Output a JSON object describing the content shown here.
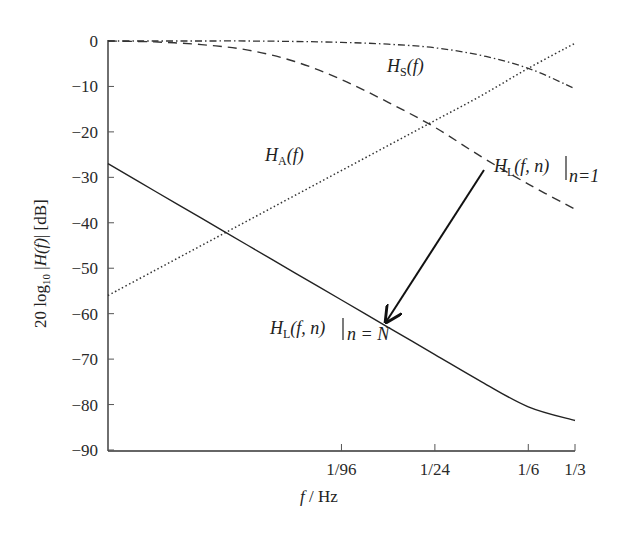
{
  "chart_data": {
    "type": "line",
    "title": "",
    "xlabel": "f / Hz",
    "ylabel": "20 log10 |H(f)| [dB]",
    "xscale": "log",
    "xlim_hz": [
      0.000326,
      0.3333
    ],
    "ylim": [
      -90,
      0
    ],
    "grid": false,
    "legend": "inline annotations",
    "x_ticks": [
      {
        "label": "1/96",
        "value": 0.0104167
      },
      {
        "label": "1/24",
        "value": 0.0416667
      },
      {
        "label": "1/6",
        "value": 0.1666667
      },
      {
        "label": "1/3",
        "value": 0.3333333
      }
    ],
    "y_ticks": [
      0,
      -10,
      -20,
      -30,
      -40,
      -50,
      -60,
      -70,
      -80,
      -90
    ],
    "y_tick_labels": [
      "0",
      "−10",
      "−20",
      "−30",
      "−40",
      "−50",
      "−60",
      "−70",
      "−80",
      "−90"
    ],
    "x_octaves_from_left": [
      0,
      1,
      2,
      3,
      4,
      5,
      6,
      7,
      8,
      9,
      10
    ],
    "series": [
      {
        "name": "H_S(f)",
        "style": "dash-dot",
        "values": [
          0,
          0,
          0,
          0,
          -0.1,
          -0.3,
          -0.7,
          -1.5,
          -3.2,
          -6.0,
          -10.5
        ]
      },
      {
        "name": "H_L(f,n)|n=1",
        "style": "dashed",
        "values": [
          0,
          -0.2,
          -0.8,
          -2.0,
          -4.5,
          -8.5,
          -13.5,
          -19.0,
          -25.5,
          -31.5,
          -37.0
        ]
      },
      {
        "name": "H_A(f)",
        "style": "dotted",
        "values": [
          -56,
          -50.5,
          -45,
          -39.5,
          -34,
          -28.5,
          -23,
          -17.5,
          -12,
          -6,
          -0.5
        ]
      },
      {
        "name": "H_L(f,n)|n=N",
        "style": "solid",
        "values": [
          -27,
          -33,
          -39,
          -45,
          -51,
          -57,
          -63,
          -69,
          -75,
          -80.5,
          -83.5
        ]
      }
    ],
    "annotations": [
      {
        "text": "H_S(f)",
        "near_octave": 6,
        "y": -6
      },
      {
        "text": "H_A(f)",
        "near_octave": 3.5,
        "y": -29
      },
      {
        "text": "H_L(f, n)|_{n=1}",
        "near_octave": 8.2,
        "y": -30
      },
      {
        "text": "H_L(f, n)|_{n=N}",
        "near_octave": 3.5,
        "y": -63
      },
      {
        "text": "arrow from n=1 curve to n=N curve",
        "from": [
          8.0,
          -28
        ],
        "to": [
          5.8,
          -61
        ]
      }
    ]
  },
  "labels": {
    "xlabel_f": "f",
    "xlabel_unit": " / Hz",
    "ylabel_prefix": "20 log",
    "ylabel_sub": "10",
    "ylabel_mid": " |",
    "ylabel_H": "H",
    "ylabel_f": "(f)",
    "ylabel_suffix": "| [dB]",
    "hs_main": "H",
    "hs_sub": "S",
    "hs_arg": "(f)",
    "ha_main": "H",
    "ha_sub": "A",
    "ha_arg": "(f)",
    "hl1_main": "H",
    "hl1_sub": "L",
    "hl1_arg": "(f, n)",
    "hl1_cond": "n=1",
    "hln_main": "H",
    "hln_sub": "L",
    "hln_arg": "(f, n)",
    "hln_cond": "n = N"
  }
}
